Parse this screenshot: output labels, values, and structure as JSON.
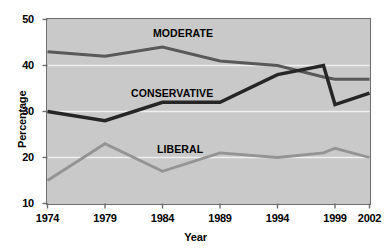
{
  "chart_data": {
    "type": "line",
    "title": "",
    "xlabel": "Year",
    "ylabel": "Percentage",
    "xlim": [
      1974,
      2002
    ],
    "ylim": [
      10,
      50
    ],
    "yticks": [
      10,
      20,
      30,
      40,
      50
    ],
    "xticks": [
      1974,
      1979,
      1984,
      1989,
      1994,
      1999,
      2002
    ],
    "grid": "horizontal-white",
    "legend": "inline-labels",
    "plot_background": "#c9c9c9",
    "x": [
      1974,
      1979,
      1984,
      1989,
      1994,
      1998,
      1999,
      2002
    ],
    "series": [
      {
        "name": "MODERATE",
        "color": "#595959",
        "width": 3.0,
        "values": [
          43,
          42,
          44,
          41,
          40,
          37.5,
          37,
          37
        ]
      },
      {
        "name": "CONSERVATIVE",
        "color": "#262626",
        "width": 3.4,
        "values": [
          30,
          28,
          32,
          32,
          38,
          40,
          31.5,
          34
        ]
      },
      {
        "name": "LIBERAL",
        "color": "#949494",
        "width": 2.8,
        "values": [
          15,
          23,
          17,
          21,
          20,
          21,
          22,
          20
        ]
      }
    ],
    "series_label_positions": [
      {
        "name": "MODERATE",
        "left": 153,
        "top": 27
      },
      {
        "name": "CONSERVATIVE",
        "left": 131,
        "top": 87
      },
      {
        "name": "LIBERAL",
        "left": 157,
        "top": 143
      }
    ],
    "ytick_labels": [
      "50",
      "40",
      "30",
      "20",
      "10"
    ],
    "xtick_labels": [
      "1974",
      "1979",
      "1984",
      "1989",
      "1994",
      "1999",
      "2002"
    ]
  }
}
